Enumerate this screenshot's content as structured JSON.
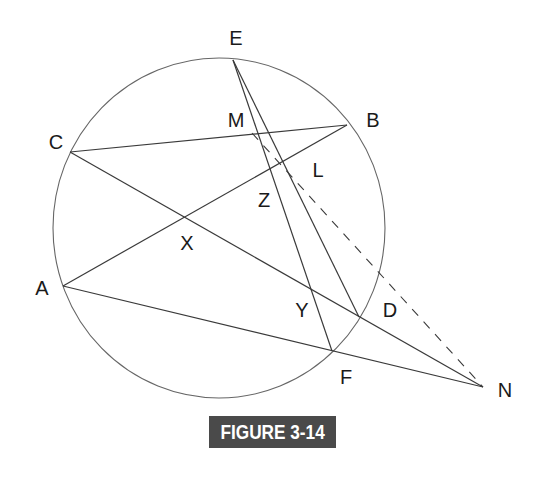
{
  "figure": {
    "caption": "FIGURE 3-14",
    "caption_bg": "#4a4a4a",
    "line_color": "#3a3a3a",
    "circle_color": "#555555"
  },
  "circle": {
    "cx": 219,
    "cy": 228,
    "rx": 166,
    "ry": 170
  },
  "points": {
    "E": {
      "label": "E",
      "x": 233,
      "y": 60,
      "lx": 236,
      "ly": 45
    },
    "B": {
      "label": "B",
      "x": 347,
      "y": 125,
      "lx": 373,
      "ly": 127
    },
    "C": {
      "label": "C",
      "x": 70,
      "y": 152,
      "lx": 56,
      "ly": 149
    },
    "A": {
      "label": "A",
      "x": 63,
      "y": 286,
      "lx": 42,
      "ly": 295
    },
    "D": {
      "label": "D",
      "x": 359,
      "y": 317,
      "lx": 390,
      "ly": 317
    },
    "F": {
      "label": "F",
      "x": 332,
      "y": 351,
      "lx": 346,
      "ly": 384
    },
    "N": {
      "label": "N",
      "x": 483,
      "y": 387,
      "lx": 505,
      "ly": 397
    },
    "M": {
      "label": "M",
      "lx": 236,
      "ly": 127
    },
    "L": {
      "label": "L",
      "lx": 318,
      "ly": 177
    },
    "Z": {
      "label": "Z",
      "lx": 264,
      "ly": 207
    },
    "X": {
      "label": "X",
      "lx": 187,
      "ly": 250
    },
    "Y": {
      "label": "Y",
      "lx": 302,
      "ly": 317
    }
  },
  "segments": [
    {
      "name": "C-B",
      "from": "C",
      "to": "B",
      "style": "solid"
    },
    {
      "name": "A-B",
      "from": "A",
      "to": "B",
      "style": "solid"
    },
    {
      "name": "C-N",
      "from": "C",
      "to": "N",
      "style": "solid"
    },
    {
      "name": "A-N",
      "from": "A",
      "to": "N",
      "style": "solid"
    },
    {
      "name": "E-F",
      "from": "E",
      "to": "F",
      "style": "solid"
    },
    {
      "name": "E-D",
      "from": "E",
      "to": "D",
      "style": "solid"
    },
    {
      "name": "M-N",
      "from": "M",
      "to": "N",
      "style": "dashed"
    }
  ]
}
